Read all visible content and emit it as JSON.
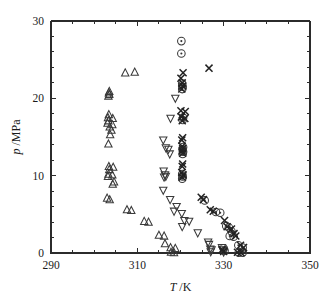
{
  "figure": {
    "kind": "scatter-plot",
    "background_color": "#ffffff",
    "frame_color": "#2b2b2b"
  },
  "axes": {
    "x_title_symbol": "T",
    "x_title_unit": "/K",
    "x_title_full": "T /K",
    "y_title_symbol": "p",
    "y_title_unit": "/MPa",
    "y_title_full": "p /MPa",
    "x_ticks": [
      "290",
      "310",
      "330",
      "350"
    ],
    "y_ticks": [
      "0",
      "10",
      "20",
      "30"
    ]
  },
  "chart_data": {
    "type": "scatter",
    "title": "",
    "xlabel": "T /K",
    "ylabel": "p /MPa",
    "xlim": [
      290,
      350
    ],
    "ylim": [
      0,
      30
    ],
    "xticks": [
      290,
      310,
      330,
      350
    ],
    "yticks": [
      0,
      10,
      20,
      30
    ],
    "x_minor_tick_interval": 5,
    "y_minor_tick_interval": 2,
    "grid": false,
    "legend": "none",
    "series": [
      {
        "name": "series-up-triangle",
        "marker": "open-up-triangle",
        "color": "#3a3a3a",
        "points": [
          [
            307.2,
            23.3
          ],
          [
            309.4,
            23.4
          ],
          [
            303.5,
            20.9
          ],
          [
            303.4,
            20.7
          ],
          [
            303.5,
            20.5
          ],
          [
            303.3,
            20.3
          ],
          [
            303.4,
            17.9
          ],
          [
            303.2,
            17.5
          ],
          [
            304.3,
            17.4
          ],
          [
            303.3,
            17.1
          ],
          [
            303.1,
            16.8
          ],
          [
            304.2,
            16.6
          ],
          [
            303.6,
            16.3
          ],
          [
            304.0,
            15.9
          ],
          [
            303.7,
            15.3
          ],
          [
            303.3,
            14.1
          ],
          [
            303.4,
            11.2
          ],
          [
            304.4,
            11.1
          ],
          [
            303.5,
            10.8
          ],
          [
            303.3,
            10.2
          ],
          [
            304.2,
            10.1
          ],
          [
            303.2,
            9.9
          ],
          [
            304.6,
            9.2
          ],
          [
            304.3,
            8.9
          ],
          [
            303.0,
            7.1
          ],
          [
            303.6,
            6.9
          ],
          [
            307.6,
            5.6
          ],
          [
            308.6,
            5.5
          ],
          [
            311.6,
            4.1
          ],
          [
            312.6,
            4.0
          ],
          [
            315.0,
            2.3
          ],
          [
            316.2,
            2.2
          ],
          [
            316.4,
            1.2
          ],
          [
            317.7,
            0.7
          ],
          [
            318.8,
            0.6
          ],
          [
            317.8,
            0.1
          ],
          [
            318.5,
            0.05
          ]
        ]
      },
      {
        "name": "series-down-triangle",
        "marker": "open-down-triangle",
        "color": "#3a3a3a",
        "points": [
          [
            318.8,
            20.0
          ],
          [
            317.7,
            17.4
          ],
          [
            316.0,
            14.6
          ],
          [
            316.6,
            13.6
          ],
          [
            317.2,
            13.4
          ],
          [
            317.5,
            12.8
          ],
          [
            316.1,
            10.6
          ],
          [
            316.4,
            10.1
          ],
          [
            316.6,
            9.9
          ],
          [
            316.2,
            9.8
          ],
          [
            316.0,
            8.1
          ],
          [
            317.6,
            6.9
          ],
          [
            319.1,
            6.0
          ],
          [
            318.5,
            5.4
          ],
          [
            320.3,
            5.1
          ],
          [
            320.9,
            4.2
          ],
          [
            322.0,
            4.1
          ],
          [
            320.4,
            3.4
          ],
          [
            324.0,
            2.6
          ],
          [
            326.4,
            1.4
          ],
          [
            326.6,
            1.1
          ],
          [
            326.9,
            0.5
          ],
          [
            327.2,
            0.4
          ],
          [
            327.0,
            0.15
          ],
          [
            329.6,
            0.7
          ],
          [
            329.8,
            0.4
          ],
          [
            330.0,
            0.1
          ]
        ]
      },
      {
        "name": "series-circle-dot",
        "marker": "circle-with-dot",
        "color": "#333333",
        "points": [
          [
            320.2,
            27.4
          ],
          [
            320.2,
            25.8
          ],
          [
            320.4,
            21.9
          ],
          [
            320.5,
            21.5
          ],
          [
            320.4,
            21.2
          ],
          [
            320.6,
            17.5
          ],
          [
            320.5,
            17.2
          ],
          [
            320.6,
            13.7
          ],
          [
            320.5,
            13.4
          ],
          [
            320.6,
            13.1
          ],
          [
            320.5,
            12.8
          ],
          [
            320.4,
            10.2
          ],
          [
            320.5,
            9.9
          ],
          [
            320.4,
            9.6
          ],
          [
            325.6,
            6.8
          ],
          [
            328.2,
            5.3
          ],
          [
            329.2,
            5.2
          ],
          [
            330.6,
            3.5
          ],
          [
            331.2,
            3.3
          ],
          [
            331.8,
            2.8
          ],
          [
            331.4,
            2.2
          ],
          [
            332.3,
            2.1
          ],
          [
            333.4,
            1.0
          ],
          [
            334.4,
            0.7
          ],
          [
            330.0,
            0.6
          ],
          [
            330.2,
            0.3
          ],
          [
            333.5,
            0.05
          ],
          [
            334.4,
            0.05
          ]
        ]
      },
      {
        "name": "series-cross",
        "marker": "cross",
        "color": "#222222",
        "points": [
          [
            326.6,
            23.9
          ],
          [
            320.6,
            23.3
          ],
          [
            320.1,
            22.6
          ],
          [
            320.4,
            22.0
          ],
          [
            320.5,
            21.6
          ],
          [
            320.3,
            21.2
          ],
          [
            320.1,
            18.4
          ],
          [
            321.1,
            18.3
          ],
          [
            320.2,
            17.6
          ],
          [
            321.0,
            17.4
          ],
          [
            320.4,
            17.1
          ],
          [
            320.5,
            14.9
          ],
          [
            320.3,
            14.6
          ],
          [
            320.4,
            13.8
          ],
          [
            320.5,
            13.5
          ],
          [
            320.4,
            13.2
          ],
          [
            320.5,
            12.9
          ],
          [
            320.5,
            11.5
          ],
          [
            320.4,
            11.2
          ],
          [
            320.3,
            10.4
          ],
          [
            320.6,
            10.1
          ],
          [
            320.4,
            9.8
          ],
          [
            324.8,
            7.2
          ],
          [
            325.3,
            6.9
          ],
          [
            326.9,
            5.6
          ],
          [
            327.6,
            5.4
          ],
          [
            330.2,
            4.2
          ],
          [
            330.8,
            3.4
          ],
          [
            331.8,
            3.1
          ],
          [
            332.4,
            2.5
          ],
          [
            332.8,
            2.2
          ],
          [
            333.9,
            1.0
          ],
          [
            334.6,
            0.7
          ],
          [
            329.6,
            0.4
          ],
          [
            330.0,
            0.2
          ],
          [
            333.2,
            0.1
          ],
          [
            334.0,
            0.05
          ]
        ]
      }
    ]
  }
}
